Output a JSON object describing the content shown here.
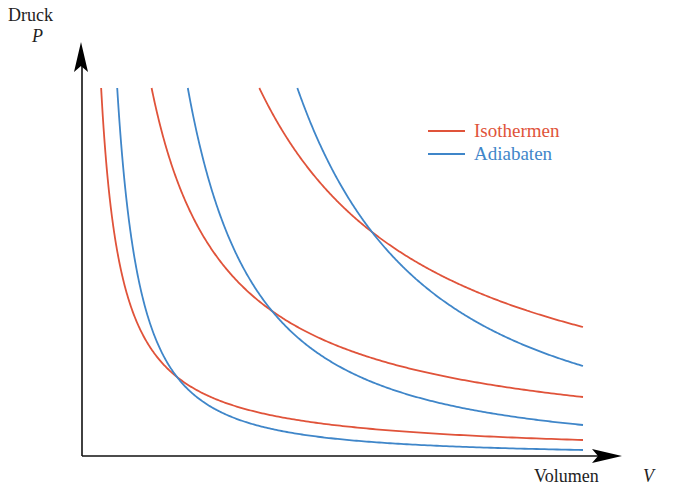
{
  "diagram": {
    "y_axis": {
      "label": "Druck",
      "symbol": "P"
    },
    "x_axis": {
      "label": "Volumen",
      "symbol": "V"
    },
    "legend": [
      {
        "label": "Isothermen",
        "color": "#e0533a"
      },
      {
        "label": "Adiabaten",
        "color": "#3f86c9"
      }
    ],
    "colors": {
      "axis": "#111111",
      "isotherm": "#e0533a",
      "adiabat": "#3f86c9",
      "background": "#ffffff"
    }
  },
  "chart_data": {
    "type": "line",
    "title": "",
    "xlabel": "Volumen V",
    "ylabel": "Druck P",
    "grid": false,
    "legend_position": "upper right",
    "axis_ticks": "none",
    "gamma": 1.4,
    "pixel_geometry": {
      "origin": [
        82,
        456
      ],
      "x_end": 583,
      "y_top": 88
    },
    "series": [
      {
        "name": "Isothermen",
        "kind": "isotherm",
        "color": "#e0533a",
        "intersection_px": [
          177,
          377
        ],
        "end_px": [
          583,
          440
        ]
      },
      {
        "name": "Isothermen",
        "kind": "isotherm",
        "color": "#e0533a",
        "intersection_px": [
          272,
          311
        ],
        "end_px": [
          583,
          397
        ]
      },
      {
        "name": "Isothermen",
        "kind": "isotherm",
        "color": "#e0533a",
        "intersection_px": [
          372,
          232
        ],
        "end_px": [
          583,
          327
        ]
      },
      {
        "name": "Adiabaten",
        "kind": "adiabat",
        "color": "#3f86c9",
        "intersection_px": [
          177,
          377
        ],
        "end_px": [
          583,
          450
        ]
      },
      {
        "name": "Adiabaten",
        "kind": "adiabat",
        "color": "#3f86c9",
        "intersection_px": [
          272,
          311
        ],
        "end_px": [
          583,
          425
        ]
      },
      {
        "name": "Adiabaten",
        "kind": "adiabat",
        "color": "#3f86c9",
        "intersection_px": [
          372,
          232
        ],
        "end_px": [
          583,
          366
        ]
      }
    ]
  }
}
